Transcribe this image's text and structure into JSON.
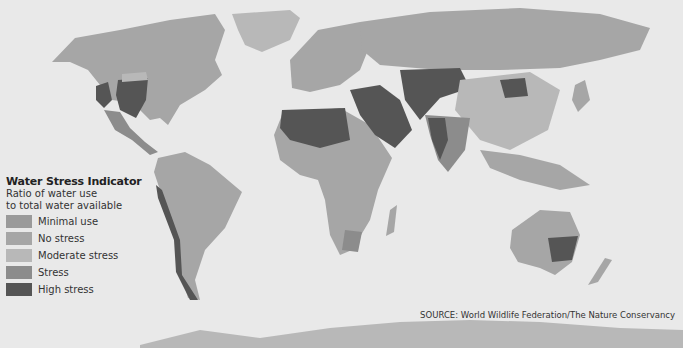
{
  "map": {
    "title": "Water Stress Indicator",
    "subtitle_line1": "Ratio of water use",
    "subtitle_line2": "to total water available",
    "background_color": "#e9e9e9",
    "legend": [
      {
        "label": "Minimal use",
        "color": "#9a9a9a"
      },
      {
        "label": "No stress",
        "color": "#a6a6a6"
      },
      {
        "label": "Moderate stress",
        "color": "#b8b8b8"
      },
      {
        "label": "Stress",
        "color": "#8c8c8c"
      },
      {
        "label": "High stress",
        "color": "#555555"
      }
    ],
    "source": "SOURCE: World Wildlife Federation/The Nature Conservancy"
  }
}
